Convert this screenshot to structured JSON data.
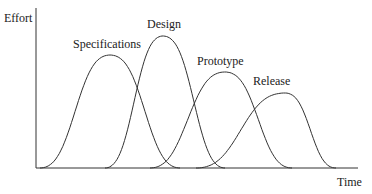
{
  "diagram": {
    "type": "effort-over-time phase curves",
    "y_axis_label": "Effort",
    "x_axis_label": "Time",
    "phases": [
      {
        "name": "Specifications",
        "start": 40,
        "peak_x": 110,
        "peak_y": 55,
        "end": 180
      },
      {
        "name": "Design",
        "start": 105,
        "peak_x": 163,
        "peak_y": 36,
        "end": 225
      },
      {
        "name": "Prototype",
        "start": 150,
        "peak_x": 225,
        "peak_y": 72,
        "end": 292
      },
      {
        "name": "Release",
        "start": 196,
        "peak_x": 285,
        "peak_y": 93,
        "end": 336
      }
    ],
    "line_color": "#333333"
  }
}
